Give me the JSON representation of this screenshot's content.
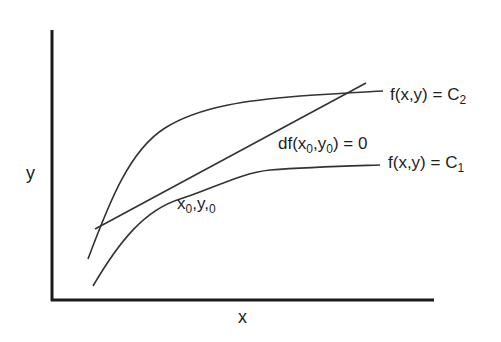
{
  "diagram": {
    "title": "",
    "axes": {
      "x_label": "x",
      "y_label": "y"
    },
    "curves": [
      {
        "id": "level-curve-c2",
        "label_prefix": "f(x,y) = C",
        "label_sub": "2"
      },
      {
        "id": "level-curve-c1",
        "label_prefix": "f(x,y) = C",
        "label_sub": "1"
      }
    ],
    "tangent_line": {
      "label_a": "df(x",
      "label_sub_a": "0",
      "label_b": ",y",
      "label_sub_b": "0",
      "label_c": ") = 0"
    },
    "point": {
      "label_a": "x",
      "label_sub_a": "0",
      "label_b": ",y,",
      "label_sub_b": "0"
    },
    "colors": {
      "axis": "#1a1a1a",
      "curve": "#333333",
      "background": "#ffffff"
    }
  }
}
